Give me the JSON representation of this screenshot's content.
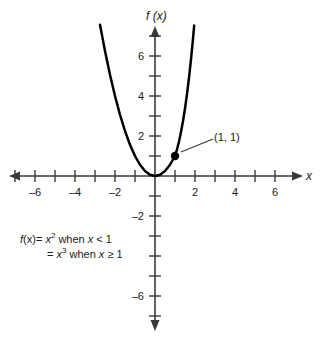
{
  "figure": {
    "x_axis_label": "x",
    "y_axis_label": "f (x)",
    "point_label": "(1, 1)",
    "caption": {
      "line1_prefix": "f",
      "line1_var": "(x)",
      "line1_eq": "= ",
      "line1_base": "x",
      "line1_exp": "2",
      "line1_cond": " when ",
      "line1_condvar": "x",
      "line1_tail": " < 1",
      "line2_eq": "= ",
      "line2_base": "x",
      "line2_exp": "3",
      "line2_cond": " when ",
      "line2_condvar": "x",
      "line2_tail": " ≥ 1"
    },
    "colors": {
      "curve": "#000000",
      "axis": "#3a3a3a",
      "text": "#1a1a1a",
      "background": "#ffffff"
    }
  },
  "chart_data": {
    "type": "line",
    "title": "",
    "xlabel": "x",
    "ylabel": "f (x)",
    "xlim": [
      -7.5,
      7.25
    ],
    "ylim": [
      -7.5,
      7.5
    ],
    "grid": false,
    "legend_position": "none",
    "x_ticks_major": [
      -6,
      -4,
      -2,
      2,
      4,
      6
    ],
    "x_ticks_minor": [
      -7,
      -5,
      -3,
      -1,
      1,
      3,
      5,
      7
    ],
    "y_ticks_major": [
      6,
      4,
      2,
      -2,
      -6
    ],
    "y_ticks_minor": [
      7,
      5,
      3,
      1,
      -1,
      -3,
      -4,
      -5,
      -7
    ],
    "x_tick_labels": [
      "–6",
      "–4",
      "–2",
      "2",
      "4",
      "6"
    ],
    "y_tick_labels": [
      "6",
      "4",
      "2",
      "–2",
      "–6"
    ],
    "pixels_per_unit": 20,
    "origin_px": [
      155,
      176
    ],
    "series": [
      {
        "name": "f(x) = x^2 when x < 1",
        "domain": [
          -2.75,
          1
        ],
        "points": [
          [
            -2.75,
            7.5625
          ],
          [
            -2.5,
            6.25
          ],
          [
            -2.25,
            5.0625
          ],
          [
            -2.0,
            4.0
          ],
          [
            -1.75,
            3.0625
          ],
          [
            -1.5,
            2.25
          ],
          [
            -1.25,
            1.5625
          ],
          [
            -1.0,
            1.0
          ],
          [
            -0.75,
            0.5625
          ],
          [
            -0.5,
            0.25
          ],
          [
            -0.25,
            0.0625
          ],
          [
            0,
            0
          ],
          [
            0.25,
            0.0625
          ],
          [
            0.5,
            0.25
          ],
          [
            0.75,
            0.5625
          ],
          [
            1.0,
            1.0
          ]
        ]
      },
      {
        "name": "f(x) = x^3 when x >= 1",
        "domain": [
          1,
          1.96
        ],
        "points": [
          [
            1.0,
            1.0
          ],
          [
            1.1,
            1.331
          ],
          [
            1.2,
            1.728
          ],
          [
            1.3,
            2.197
          ],
          [
            1.4,
            2.744
          ],
          [
            1.5,
            3.375
          ],
          [
            1.6,
            4.096
          ],
          [
            1.7,
            4.913
          ],
          [
            1.8,
            5.832
          ],
          [
            1.9,
            6.859
          ],
          [
            1.96,
            7.53
          ]
        ]
      }
    ],
    "annotations": [
      {
        "label": "(1, 1)",
        "point": [
          1,
          1
        ],
        "marker": "filled-circle",
        "leader_to": [
          3.1,
          2.0
        ]
      }
    ]
  }
}
